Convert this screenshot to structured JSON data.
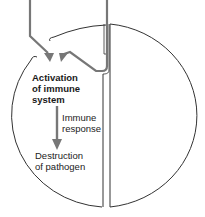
{
  "diagram": {
    "labels": {
      "activation_line1": "Activation",
      "activation_line2": "of immune",
      "activation_line3": "system",
      "response_line1": "Immune",
      "response_line2": "response",
      "destruction_line1": "Destruction",
      "destruction_line2": "of pathogen"
    },
    "colors": {
      "outline": "#333333",
      "arrow": "#777777",
      "text": "#222222"
    }
  }
}
